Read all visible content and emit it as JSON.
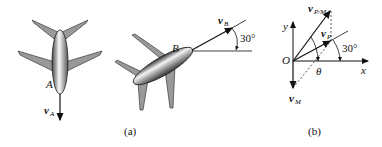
{
  "part_a": {
    "caption": "(a)",
    "plane_a": {
      "label": "A",
      "velocity": {
        "symbol": "v",
        "subscript": "A"
      }
    },
    "plane_b": {
      "label": "B",
      "velocity": {
        "symbol": "v",
        "subscript": "B"
      },
      "angle": "30°"
    }
  },
  "part_b": {
    "caption": "(b)",
    "origin": "O",
    "x_axis": "x",
    "y_axis": "y",
    "vectors": [
      {
        "symbol": "v",
        "subscript": "P/M"
      },
      {
        "symbol": "v",
        "subscript": "P"
      },
      {
        "symbol": "v",
        "subscript": "M"
      }
    ],
    "angle_theta": "θ",
    "angle_30": "30°"
  },
  "colors": {
    "ink": "#111111",
    "wing": "#9a9a9a",
    "fuselage_light": "#f2f2f2",
    "fuselage_dark": "#555555"
  }
}
